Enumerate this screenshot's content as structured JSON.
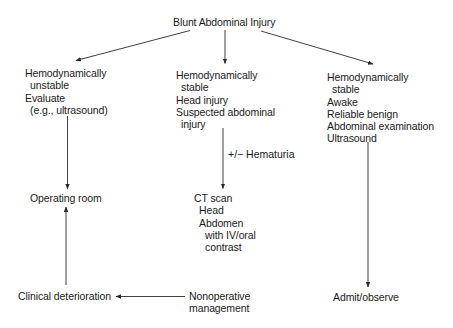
{
  "diagram": {
    "title": "Blunt Abdominal Injury",
    "nodes": {
      "root": {
        "lines": [
          "Blunt Abdominal Injury"
        ]
      },
      "unstable": {
        "lines": [
          "Hemodynamically",
          "unstable",
          "Evaluate",
          "(e.g., ultrasound)"
        ]
      },
      "stable_head": {
        "lines": [
          "Hemodynamically",
          "stable",
          "Head injury",
          "Suspected abdominal",
          "injury"
        ]
      },
      "stable_awake": {
        "lines": [
          "Hemodynamically",
          "stable",
          "Awake",
          "Reliable benign",
          "Abdominal examination",
          "Ultrasound"
        ]
      },
      "operating_room": {
        "lines": [
          "Operating room"
        ]
      },
      "ct_scan": {
        "lines": [
          "CT scan",
          "Head",
          "Abdomen",
          "with IV/oral",
          "contrast"
        ]
      },
      "clinical_deterioration": {
        "lines": [
          "Clinical deterioration"
        ]
      },
      "nonoperative": {
        "lines": [
          "Nonoperative",
          "management"
        ]
      },
      "admit_observe": {
        "lines": [
          "Admit/observe"
        ]
      }
    },
    "edges": [
      {
        "from": "root",
        "to": "unstable",
        "label": ""
      },
      {
        "from": "root",
        "to": "stable_head",
        "label": ""
      },
      {
        "from": "root",
        "to": "stable_awake",
        "label": ""
      },
      {
        "from": "unstable",
        "to": "operating_room",
        "label": ""
      },
      {
        "from": "stable_head",
        "to": "ct_scan",
        "label": "+/− Hematuria"
      },
      {
        "from": "stable_awake",
        "to": "admit_observe",
        "label": ""
      },
      {
        "from": "nonoperative",
        "to": "clinical_deterioration",
        "label": ""
      },
      {
        "from": "clinical_deterioration",
        "to": "operating_room",
        "label": ""
      }
    ],
    "colors": {
      "line": "#2a2a2a",
      "text": "#1a1a1a",
      "background": "#ffffff"
    }
  }
}
